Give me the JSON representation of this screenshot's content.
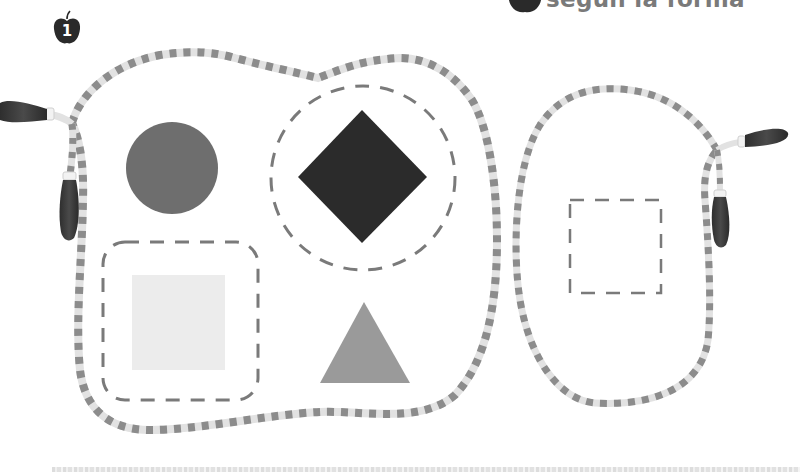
{
  "header": {
    "title": "según la forma",
    "icon": "apple-icon"
  },
  "page_badge": {
    "number": "1",
    "icon": "apple-icon"
  },
  "activity": {
    "left_rope_loop": {
      "shapes": [
        {
          "type": "circle",
          "fill": "#6e6e6e",
          "outlined": false
        },
        {
          "type": "diamond",
          "fill": "#2b2b2b",
          "outlined": true,
          "outline": "dashed-circle"
        },
        {
          "type": "square",
          "fill": "#ececec",
          "outlined": true,
          "outline": "dashed-rounded-square"
        },
        {
          "type": "triangle",
          "fill": "#9a9a9a",
          "outlined": false
        }
      ]
    },
    "right_rope_loop": {
      "shapes": [
        {
          "type": "dashed-square-outline",
          "fill": "none"
        }
      ]
    }
  },
  "colors": {
    "rope_dark": "#8c8c8c",
    "rope_light": "#e2e2e2",
    "handle": "#3a3a3a",
    "dash": "#7a7a7a",
    "title": "#7a7a7a"
  }
}
